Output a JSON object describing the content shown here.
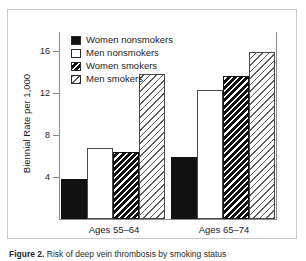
{
  "figure": {
    "caption_label": "Figure 2.",
    "caption_text": "Risk of deep vein thrombosis by smoking status"
  },
  "legend": {
    "position": "top-left-inside",
    "items": [
      {
        "label": "Women nonsmokers",
        "pattern": "solid-black"
      },
      {
        "label": "Men nonsmokers",
        "pattern": "empty-white"
      },
      {
        "label": "Women smokers",
        "pattern": "dense-hatch"
      },
      {
        "label": "Men smokers",
        "pattern": "light-hatch"
      }
    ]
  },
  "axes": {
    "y_title": "Biennial Rate per 1,000",
    "y_ticks": [
      "4",
      "8",
      "12",
      "16"
    ],
    "x_groups": [
      "Ages 55–64",
      "Ages 65–74"
    ]
  },
  "chart_data": {
    "type": "bar",
    "title": "",
    "xlabel": "",
    "ylabel": "Biennial Rate per 1,000",
    "categories": [
      "Ages 55–64",
      "Ages 65–74"
    ],
    "ylim": [
      0,
      18
    ],
    "ytick_values": [
      4,
      8,
      12,
      16
    ],
    "grid": false,
    "legend_position": "upper left",
    "series": [
      {
        "name": "Women nonsmokers",
        "values": [
          3.8,
          5.9
        ],
        "pattern": "solid-black"
      },
      {
        "name": "Men nonsmokers",
        "values": [
          6.8,
          12.3
        ],
        "pattern": "empty-white"
      },
      {
        "name": "Women smokers",
        "values": [
          6.4,
          13.6
        ],
        "pattern": "dense-hatch"
      },
      {
        "name": "Men smokers",
        "values": [
          13.8,
          15.9
        ],
        "pattern": "light-hatch"
      }
    ]
  }
}
